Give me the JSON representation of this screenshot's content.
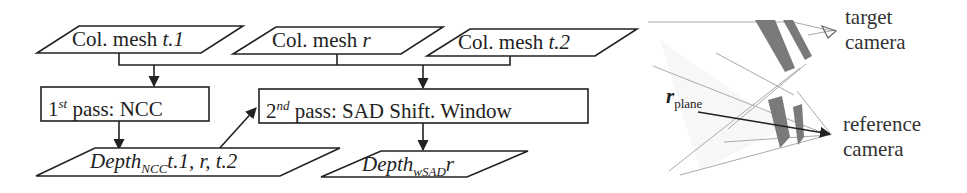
{
  "flowchart": {
    "inputs": [
      {
        "prefix": "Col. mesh ",
        "var": "t.1"
      },
      {
        "prefix": "Col. mesh ",
        "var": "r"
      },
      {
        "prefix": "Col. mesh ",
        "var": "t.2"
      }
    ],
    "pass1": {
      "ordinal": "1",
      "sup": "st",
      "text": " pass: NCC"
    },
    "pass2": {
      "ordinal": "2",
      "sup": "nd",
      "text": " pass: SAD Shift. Window"
    },
    "output1": {
      "base": "Depth",
      "sub": "NCC",
      "tail": "t.1, r, t.2"
    },
    "output2": {
      "base": "Depth",
      "sub": "wSAD",
      "tail": "r"
    }
  },
  "camera_diagram": {
    "target_label_line1": "target",
    "target_label_line2": "camera",
    "reference_label_line1": "reference",
    "reference_label_line2": "camera",
    "plane_symbol": "r",
    "plane_subscript": "plane",
    "stripe_color": "#7a7a7a",
    "ray_color": "#999999"
  }
}
